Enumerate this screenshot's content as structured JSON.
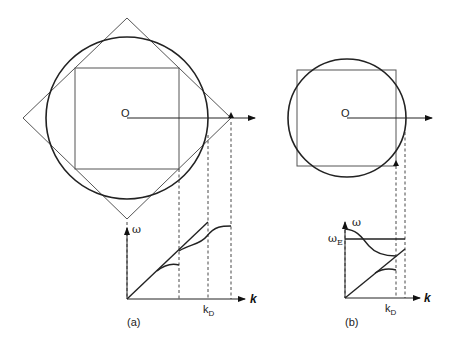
{
  "figure": {
    "panel_a": {
      "caption": "(a)",
      "origin_label": "O",
      "omega_label": "ω",
      "k_label": "k",
      "kd_label": "k",
      "kd_sub": "D"
    },
    "panel_b": {
      "caption": "(b)",
      "origin_label": "O",
      "omega_label": "ω",
      "omegaE_label": "ω",
      "omegaE_sub": "E",
      "k_label": "k",
      "kd_label": "k",
      "kd_sub": "D"
    }
  }
}
